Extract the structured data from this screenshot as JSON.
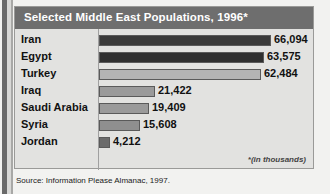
{
  "chart_data": {
    "type": "bar",
    "title": "Selected Middle East Populations, 1996*",
    "orientation": "horizontal",
    "xlabel": "",
    "ylabel": "",
    "categories": [
      "Iran",
      "Egypt",
      "Turkey",
      "Iraq",
      "Saudi Arabia",
      "Syria",
      "Jordan"
    ],
    "values": [
      66094,
      63575,
      62484,
      21422,
      19409,
      15608,
      4212
    ],
    "value_labels": [
      "66,094",
      "63,575",
      "62,484",
      "21,422",
      "19,409",
      "15,608",
      "4,212"
    ],
    "bar_colors": [
      "#3a3a3a",
      "#2f2f2f",
      "#b4b4b4",
      "#9a9a9a",
      "#9a9a9a",
      "#8f8f8f",
      "#6b6b6b"
    ],
    "xlim": [
      0,
      70000
    ],
    "grid": false,
    "legend": null,
    "units_note": "*(in thousands)",
    "source": "Source: Information Please Almanac, 1997."
  },
  "panel": {
    "title": "Selected Middle East Populations, 1996*",
    "footnote": "*(in thousands)"
  },
  "source_line": "Source: Information Please Almanac, 1997."
}
